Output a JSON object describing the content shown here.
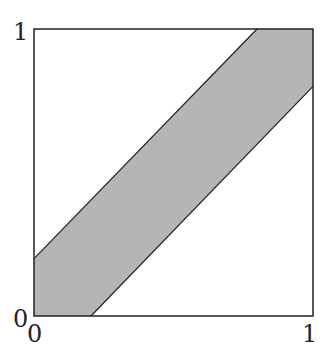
{
  "diagram": {
    "band_halfwidth": 0.2,
    "fill_color": "#b5b5b5",
    "stroke_color": "#222222"
  },
  "labels": {
    "y_top": "1",
    "y_bottom": "0",
    "x_left": "0",
    "x_right": "1"
  }
}
